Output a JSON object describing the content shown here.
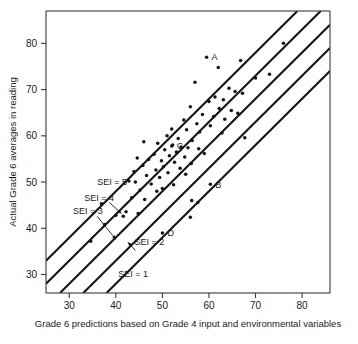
{
  "chart_data": {
    "type": "scatter",
    "title": "",
    "xlabel": "Grade 6 predictions based on Grade 4 input and environmental variables",
    "ylabel": "Actual Grade 6 averages in reading",
    "xlim": [
      25,
      86
    ],
    "ylim": [
      26,
      87
    ],
    "xticks": [
      30,
      40,
      50,
      60,
      70,
      80
    ],
    "yticks": [
      30,
      40,
      50,
      60,
      70,
      80
    ],
    "xticklabels": [
      "30",
      "40",
      "50",
      "60",
      "70",
      "80"
    ],
    "yticklabels": [
      "30",
      "40",
      "50",
      "60",
      "70",
      "80"
    ],
    "grid": false,
    "legend": "none",
    "points": [
      [
        59.5,
        77.0
      ],
      [
        62.0,
        74.8
      ],
      [
        57.0,
        71.6
      ],
      [
        66.8,
        76.3
      ],
      [
        76.0,
        80.0
      ],
      [
        73.0,
        73.3
      ],
      [
        70.0,
        72.5
      ],
      [
        64.3,
        70.3
      ],
      [
        65.6,
        69.6
      ],
      [
        67.2,
        69.2
      ],
      [
        61.3,
        68.4
      ],
      [
        63.1,
        67.8
      ],
      [
        60.0,
        67.4
      ],
      [
        56.0,
        66.3
      ],
      [
        62.2,
        65.9
      ],
      [
        64.8,
        65.5
      ],
      [
        66.2,
        64.9
      ],
      [
        58.6,
        64.6
      ],
      [
        61.0,
        64.2
      ],
      [
        63.4,
        63.6
      ],
      [
        54.6,
        63.4
      ],
      [
        57.4,
        62.6
      ],
      [
        60.3,
        62.2
      ],
      [
        52.0,
        61.5
      ],
      [
        55.2,
        61.3
      ],
      [
        58.0,
        60.8
      ],
      [
        62.8,
        60.6
      ],
      [
        67.7,
        59.6
      ],
      [
        51.0,
        60.0
      ],
      [
        53.4,
        59.4
      ],
      [
        56.4,
        59.0
      ],
      [
        46.0,
        58.7
      ],
      [
        49.0,
        58.4
      ],
      [
        52.2,
        58.0
      ],
      [
        54.0,
        57.6
      ],
      [
        55.5,
        57.4
      ],
      [
        57.8,
        57.2
      ],
      [
        50.5,
        57.0
      ],
      [
        53.0,
        56.5
      ],
      [
        59.0,
        56.2
      ],
      [
        48.2,
        56.0
      ],
      [
        51.5,
        55.7
      ],
      [
        54.8,
        55.4
      ],
      [
        44.6,
        55.2
      ],
      [
        47.0,
        54.9
      ],
      [
        49.8,
        54.6
      ],
      [
        52.6,
        54.3
      ],
      [
        56.2,
        54.0
      ],
      [
        45.8,
        53.6
      ],
      [
        50.2,
        53.3
      ],
      [
        53.8,
        53.0
      ],
      [
        48.6,
        52.6
      ],
      [
        43.9,
        52.3
      ],
      [
        51.2,
        52.0
      ],
      [
        55.0,
        51.7
      ],
      [
        46.6,
        51.4
      ],
      [
        49.4,
        51.0
      ],
      [
        42.8,
        50.2
      ],
      [
        44.2,
        50.0
      ],
      [
        47.6,
        49.6
      ],
      [
        52.4,
        49.4
      ],
      [
        50.0,
        48.6
      ],
      [
        45.2,
        48.3
      ],
      [
        48.8,
        48.0
      ],
      [
        43.4,
        46.6
      ],
      [
        46.2,
        46.2
      ],
      [
        56.3,
        46.0
      ],
      [
        57.6,
        45.6
      ],
      [
        36.9,
        45.3
      ],
      [
        42.2,
        43.6
      ],
      [
        44.8,
        43.2
      ],
      [
        40.0,
        42.8
      ],
      [
        41.6,
        42.6
      ],
      [
        56.0,
        42.4
      ],
      [
        37.6,
        40.8
      ],
      [
        34.6,
        37.2
      ],
      [
        50.0,
        39.0
      ],
      [
        60.3,
        49.5
      ],
      [
        52.0,
        57.8
      ]
    ],
    "labeled_points": [
      {
        "id": "A",
        "x": 59.5,
        "y": 77.0
      },
      {
        "id": "B",
        "x": 60.3,
        "y": 49.5
      },
      {
        "id": "C",
        "x": 52.0,
        "y": 57.8
      },
      {
        "id": "D",
        "x": 50.0,
        "y": 39.0
      }
    ],
    "sei_lines": [
      {
        "label": "SEI = 5",
        "intercept": 8.0
      },
      {
        "label": "SEI = 4",
        "intercept": 3.0
      },
      {
        "label": "SEI = 3",
        "intercept": -2.0
      },
      {
        "label": "SEI = 2",
        "intercept": -7.0
      },
      {
        "label": "SEI = 1",
        "intercept": -12.0
      }
    ],
    "sei_line_slope": 1.0,
    "annotations": [
      {
        "text": "SEI = 5",
        "x": 36.0,
        "y": 49.3
      },
      {
        "text": "SEI = 4",
        "x": 33.2,
        "y": 46.0
      },
      {
        "text": "SEI = 3",
        "x": 30.8,
        "y": 43.0
      },
      {
        "text": "SEI = 2",
        "x": 44.0,
        "y": 36.3
      },
      {
        "text": "SEI = 1",
        "x": 40.5,
        "y": 29.5
      }
    ]
  }
}
